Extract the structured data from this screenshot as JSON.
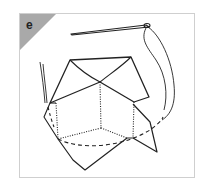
{
  "figure": {
    "panel_label": "e"
  },
  "colors": {
    "corner_tab": "#a9a9a9",
    "stroke": "#222222",
    "frame_border": "#cfcfcf"
  }
}
